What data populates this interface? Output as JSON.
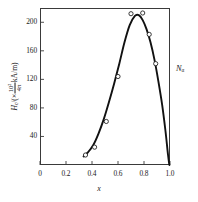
{
  "chart_data": {
    "type": "scatter",
    "title": "",
    "subtitle": "",
    "xlabel": "x",
    "ylabel_parts": {
      "symbol": "H",
      "symbol_sub": "c",
      "prefix": "/(×",
      "numerator": "10²",
      "denominator": "4π",
      "unit": "kA/m)",
      "full": "Hc/(× 10²/4π kA/m)"
    },
    "right_axis_label": {
      "symbol": "N",
      "sub": "α",
      "full": "Nα"
    },
    "xlim": [
      0,
      1.0
    ],
    "ylim": [
      0,
      220
    ],
    "xticks": [
      0,
      0.2,
      0.4,
      0.6,
      0.8,
      1.0
    ],
    "xticklabels": [
      "0",
      "0.2",
      "0.4",
      "0.6",
      "0.8",
      "1.0"
    ],
    "yticks": [
      40,
      80,
      120,
      160,
      200
    ],
    "yticklabels": [
      "40",
      "80",
      "120",
      "160",
      "200"
    ],
    "grid": false,
    "legend": false,
    "marker": "open-circle",
    "points": [
      {
        "x": 0.35,
        "y": 14
      },
      {
        "x": 0.42,
        "y": 25
      },
      {
        "x": 0.51,
        "y": 61
      },
      {
        "x": 0.6,
        "y": 124
      },
      {
        "x": 0.7,
        "y": 212
      },
      {
        "x": 0.79,
        "y": 213
      },
      {
        "x": 0.84,
        "y": 183
      },
      {
        "x": 0.89,
        "y": 142
      }
    ],
    "fit_curve": [
      {
        "x": 0.335,
        "y": 12
      },
      {
        "x": 0.37,
        "y": 18
      },
      {
        "x": 0.41,
        "y": 28
      },
      {
        "x": 0.45,
        "y": 44
      },
      {
        "x": 0.49,
        "y": 64
      },
      {
        "x": 0.53,
        "y": 88
      },
      {
        "x": 0.57,
        "y": 114
      },
      {
        "x": 0.61,
        "y": 142
      },
      {
        "x": 0.65,
        "y": 172
      },
      {
        "x": 0.69,
        "y": 196
      },
      {
        "x": 0.73,
        "y": 209
      },
      {
        "x": 0.76,
        "y": 210
      },
      {
        "x": 0.79,
        "y": 203
      },
      {
        "x": 0.82,
        "y": 190
      },
      {
        "x": 0.85,
        "y": 172
      },
      {
        "x": 0.88,
        "y": 148
      },
      {
        "x": 0.91,
        "y": 118
      },
      {
        "x": 0.94,
        "y": 84
      },
      {
        "x": 0.965,
        "y": 48
      },
      {
        "x": 0.985,
        "y": 14
      },
      {
        "x": 0.995,
        "y": 0
      }
    ]
  },
  "axes": {
    "line_color": "#3a3a3a",
    "curve_color": "#111111",
    "marker_edge_color": "#1a1a1a",
    "marker_fill_color": "#ffffff",
    "background_color": "#ffffff"
  }
}
